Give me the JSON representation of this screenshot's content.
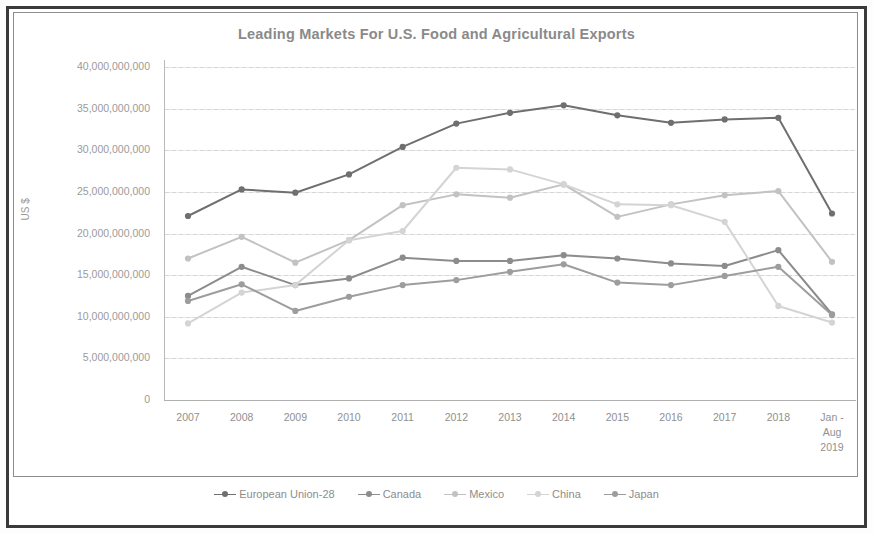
{
  "figure": {
    "title": "Leading Markets For U.S. Food and Agricultural Exports",
    "y_axis_title": "US $"
  },
  "legend": {
    "position": "bottom",
    "items": [
      {
        "label": "European Union-28",
        "color": "#6f6f6f"
      },
      {
        "label": "Canada",
        "color": "#8c8c8c"
      },
      {
        "label": "Mexico",
        "color": "#c2c2c2"
      },
      {
        "label": "China",
        "color": "#d4d4d4"
      },
      {
        "label": "Japan",
        "color": "#9d9d9d"
      }
    ]
  },
  "axis": {
    "y_ticks": [
      "40,000,000,000",
      "35,000,000,000",
      "30,000,000,000",
      "25,000,000,000",
      "20,000,000,000",
      "15,000,000,000",
      "10,000,000,000",
      "5,000,000,000",
      "0"
    ],
    "x_ticks": [
      "2007",
      "2008",
      "2009",
      "2010",
      "2011",
      "2012",
      "2013",
      "2014",
      "2015",
      "2016",
      "2017",
      "2018",
      "Jan -\nAug\n2019"
    ]
  },
  "chart_data": {
    "type": "line",
    "title": "Leading Markets For U.S. Food and Agricultural Exports",
    "xlabel": "",
    "ylabel": "US $",
    "ylim": [
      0,
      40000000000
    ],
    "ytick_step": 5000000000,
    "grid": true,
    "legend_position": "bottom",
    "categories": [
      "2007",
      "2008",
      "2009",
      "2010",
      "2011",
      "2012",
      "2013",
      "2014",
      "2015",
      "2016",
      "2017",
      "2018",
      "Jan - Aug 2019"
    ],
    "series": [
      {
        "name": "European Union-28",
        "color": "#6f6f6f",
        "values": [
          22100000000,
          25300000000,
          24900000000,
          27100000000,
          30400000000,
          33200000000,
          34500000000,
          35400000000,
          34200000000,
          33300000000,
          33700000000,
          33900000000,
          22400000000
        ]
      },
      {
        "name": "Canada",
        "color": "#8c8c8c",
        "values": [
          12500000000,
          16000000000,
          13800000000,
          14600000000,
          17100000000,
          16700000000,
          16700000000,
          17400000000,
          17000000000,
          16400000000,
          16100000000,
          18000000000,
          10300000000
        ]
      },
      {
        "name": "Mexico",
        "color": "#c2c2c2",
        "values": [
          17000000000,
          19600000000,
          16500000000,
          19200000000,
          23400000000,
          24700000000,
          24300000000,
          25900000000,
          22000000000,
          23500000000,
          24600000000,
          25100000000,
          16600000000
        ]
      },
      {
        "name": "China",
        "color": "#d4d4d4",
        "values": [
          9200000000,
          12900000000,
          13800000000,
          19200000000,
          20300000000,
          27900000000,
          27700000000,
          25900000000,
          23500000000,
          23400000000,
          21400000000,
          11300000000,
          9300000000
        ]
      },
      {
        "name": "Japan",
        "color": "#9d9d9d",
        "values": [
          11900000000,
          13900000000,
          10700000000,
          12400000000,
          13800000000,
          14400000000,
          15400000000,
          16300000000,
          14100000000,
          13800000000,
          14900000000,
          16000000000,
          10200000000
        ]
      }
    ]
  }
}
